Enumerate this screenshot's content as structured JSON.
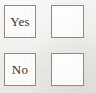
{
  "document": {
    "type": "form-fragment",
    "description": "Yes/No response boxes with adjacent empty tick boxes",
    "background_color": "#f1f0ee",
    "border_color": "#8c8a87",
    "box_fill_color": "#fbfbfa",
    "text_color": "#34312e"
  },
  "rows": [
    {
      "label": "Yes",
      "label_box": {
        "checked": false
      },
      "tick_box": {
        "value": "",
        "checked": false
      }
    },
    {
      "label": "No",
      "label_box": {
        "checked": false
      },
      "tick_box": {
        "value": "",
        "checked": false
      }
    }
  ]
}
